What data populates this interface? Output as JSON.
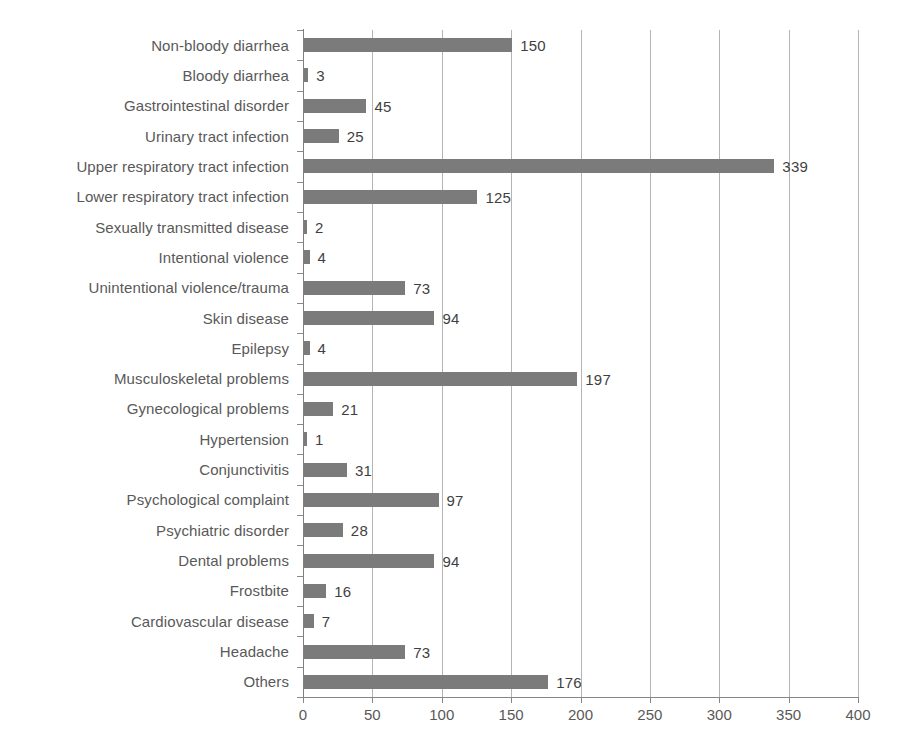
{
  "chart_data": {
    "type": "bar",
    "orientation": "horizontal",
    "title": "",
    "subtitle": "",
    "xlabel": "",
    "ylabel": "",
    "xlim": [
      0,
      400
    ],
    "xticks": [
      0,
      50,
      100,
      150,
      200,
      250,
      300,
      350,
      400
    ],
    "grid": true,
    "grid_axis": "x",
    "legend": false,
    "bar_color": "#7b7b7b",
    "label_color": "#595959",
    "value_label_color": "#3f3f3f",
    "categories": [
      "Non-bloody diarrhea",
      "Bloody diarrhea",
      "Gastrointestinal disorder",
      "Urinary tract infection",
      "Upper respiratory tract infection",
      "Lower respiratory tract infection",
      "Sexually transmitted disease",
      "Intentional violence",
      "Unintentional violence/trauma",
      "Skin disease",
      "Epilepsy",
      "Musculoskeletal problems",
      "Gynecological problems",
      "Hypertension",
      "Conjunctivitis",
      "Psychological complaint",
      "Psychiatric disorder",
      "Dental problems",
      "Frostbite",
      "Cardiovascular disease",
      "Headache",
      "Others"
    ],
    "values": [
      150,
      3,
      45,
      25,
      339,
      125,
      2,
      4,
      73,
      94,
      4,
      197,
      21,
      1,
      31,
      97,
      28,
      94,
      16,
      7,
      73,
      176
    ],
    "value_labels": [
      "150",
      "3",
      "45",
      "25",
      "339",
      "125",
      "2",
      "4",
      "73",
      "94",
      "4",
      "197",
      "21",
      "1",
      "31",
      "97",
      "28",
      "94",
      "16",
      "7",
      "73",
      "176"
    ],
    "xtick_labels": [
      "0",
      "50",
      "100",
      "150",
      "200",
      "250",
      "300",
      "350",
      "400"
    ]
  }
}
